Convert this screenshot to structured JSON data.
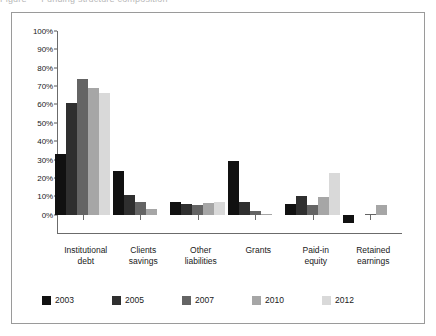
{
  "caption_sliver": "Figure — Funding structure composition",
  "chart_data": {
    "type": "bar",
    "title": "",
    "subtitle": "",
    "xlabel": "",
    "ylabel": "",
    "ylim": [
      -10,
      100
    ],
    "grid": false,
    "legend_position": "bottom",
    "y_tick_labels": [
      "100%",
      "90%",
      "80%",
      "70%",
      "60%",
      "50%",
      "40%",
      "30%",
      "20%",
      "10%",
      "0%"
    ],
    "y_tick_values": [
      100,
      90,
      80,
      70,
      60,
      50,
      40,
      30,
      20,
      10,
      0
    ],
    "categories": [
      "Institutional debt",
      "Clients savings",
      "Other liabilities",
      "Grants",
      "Paid-in equity",
      "Retained earnings"
    ],
    "category_lines": [
      [
        "Institutional",
        "debt"
      ],
      [
        "Clients",
        "savings"
      ],
      [
        "Other",
        "liabilities"
      ],
      [
        "Grants"
      ],
      [
        "Paid-in",
        "equity"
      ],
      [
        "Retained",
        "earnings"
      ]
    ],
    "series": [
      {
        "name": "2003",
        "color": "#111111",
        "values": [
          33,
          24,
          7,
          29,
          6,
          -4.5
        ]
      },
      {
        "name": "2005",
        "color": "#2f2f2f",
        "values": [
          61,
          10.5,
          6,
          7,
          10,
          0
        ]
      },
      {
        "name": "2007",
        "color": "#646464",
        "values": [
          74,
          7,
          5.5,
          2,
          5,
          0.5
        ]
      },
      {
        "name": "2010",
        "color": "#a6a6a6",
        "values": [
          69,
          3,
          6.5,
          0.3,
          9.5,
          5.2
        ]
      },
      {
        "name": "2012",
        "color": "#d9d9d9",
        "values": [
          66,
          0,
          7,
          0,
          22.5,
          0
        ]
      }
    ]
  },
  "legend": {
    "items": [
      {
        "label": "2003",
        "color": "#111111"
      },
      {
        "label": "2005",
        "color": "#2f2f2f"
      },
      {
        "label": "2007",
        "color": "#646464"
      },
      {
        "label": "2010",
        "color": "#a6a6a6"
      },
      {
        "label": "2012",
        "color": "#d9d9d9"
      }
    ]
  }
}
